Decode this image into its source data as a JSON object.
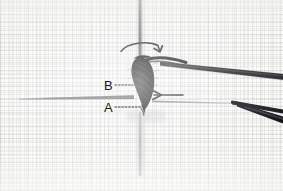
{
  "figure": {
    "kind": "macro-photograph",
    "background": "fine woven fabric / graph-paper grid",
    "base_color": "#fbfbfa",
    "grid_color": "#96968f",
    "instrument_color": "#1b1b1d",
    "annotation_color": "#17181a"
  },
  "annotations": {
    "label_b": {
      "text": "B",
      "leader": "dotted",
      "points_to": "coiled suture loop wrapped around the vertical needle shaft"
    },
    "label_a": {
      "text": "A",
      "leader": "dotted",
      "points_to": "free end of the suture at the base of the horizontal needle"
    },
    "rotation_arrow": {
      "name": "curved-rotation-arrow",
      "direction": "clockwise",
      "description": "curved arrow arcing over the vertical needle indicating the needle is rotated"
    },
    "push_arrow": {
      "name": "straight-left-arrow",
      "direction": "left",
      "description": "straight arrow pointing left toward the suture coil indicating the direction the loop is advanced"
    }
  },
  "objects": {
    "vertical_needle": "vertical needle shaft running top to bottom through the knot",
    "horizontal_needle": "thin tapered horizontal needle entering from the left",
    "suture_coil": "dense dark teardrop-shaped coil of suture thread",
    "suture_thread": "dark suture strand running up and to the right from the coil",
    "forceps_upper_arm": "upper arm of the forceps entering from the right",
    "forceps_lower_arm": "lower arm of the forceps entering from the right",
    "forceps_tip": "converging tips of the forceps"
  }
}
